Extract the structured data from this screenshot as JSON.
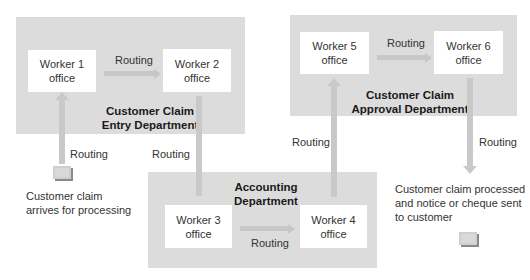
{
  "diagram": {
    "departments": {
      "entry": {
        "title_line1": "Customer Claim",
        "title_line2": "Entry Department"
      },
      "approval": {
        "title_line1": "Customer Claim",
        "title_line2": "Approval Department"
      },
      "accounting": {
        "title_line1": "Accounting",
        "title_line2": "Department"
      }
    },
    "offices": {
      "worker1": {
        "line1": "Worker 1",
        "line2": "office"
      },
      "worker2": {
        "line1": "Worker 2",
        "line2": "office"
      },
      "worker3": {
        "line1": "Worker 3",
        "line2": "office"
      },
      "worker4": {
        "line1": "Worker 4",
        "line2": "office"
      },
      "worker5": {
        "line1": "Worker 5",
        "line2": "office"
      },
      "worker6": {
        "line1": "Worker 6",
        "line2": "office"
      }
    },
    "routing_labels": {
      "w1_to_w2": "Routing",
      "intake_to_w1": "Routing",
      "w2_to_w3": "Routing",
      "w3_to_w4": "Routing",
      "w4_to_w5": "Routing",
      "w5_to_w6": "Routing",
      "w6_to_output": "Routing"
    },
    "start": {
      "caption_line1": "Customer claim",
      "caption_line2": "arrives for processing",
      "icon": "document-icon"
    },
    "end": {
      "caption_line1": "Customer claim processed",
      "caption_line2": "and notice or cheque sent",
      "caption_line3": "to customer",
      "icon": "document-icon"
    },
    "colors": {
      "department_bg": "#dcdcdc",
      "office_bg": "#ffffff",
      "arrow": "#c9c9c9",
      "text": "#333333"
    }
  }
}
